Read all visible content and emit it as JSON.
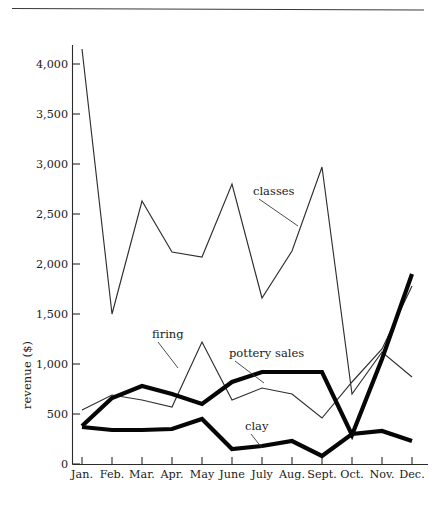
{
  "figure": {
    "y_axis_label": "revenue ($)",
    "has_top_rule": true
  },
  "chart_data": {
    "type": "line",
    "title": "",
    "subtitle": "",
    "xlabel": "",
    "ylabel": "revenue ($)",
    "categories": [
      "Jan.",
      "Feb.",
      "Mar.",
      "Apr.",
      "May",
      "June",
      "July",
      "Aug.",
      "Sept.",
      "Oct.",
      "Nov.",
      "Dec."
    ],
    "x_tick_labels": [
      "Jan.",
      "Feb.",
      "Mar.",
      "Apr.",
      "May",
      "June",
      "July",
      "Aug.",
      "Sept.",
      "Oct.",
      "Nov.",
      "Dec."
    ],
    "y_tick_labels": [
      "0",
      "500",
      "1,000",
      "1,500",
      "2,000",
      "2,500",
      "3,000",
      "3,500",
      "4,000"
    ],
    "y_tick_values": [
      0,
      500,
      1000,
      1500,
      2000,
      2500,
      3000,
      3500,
      4000
    ],
    "ylim": [
      0,
      4300
    ],
    "grid": false,
    "legend_position": "inline-annotations",
    "series": [
      {
        "name": "classes",
        "style": "thin",
        "color": "#2f2f2f",
        "values": [
          4150,
          1500,
          2630,
          2120,
          2070,
          2800,
          1660,
          2130,
          2970,
          700,
          1120,
          870
        ]
      },
      {
        "name": "firing",
        "style": "thin",
        "color": "#2f2f2f",
        "values": [
          540,
          690,
          640,
          570,
          1220,
          640,
          760,
          700,
          460,
          820,
          1150,
          1780
        ]
      },
      {
        "name": "pottery sales",
        "style": "thick",
        "color": "#060606",
        "values": [
          380,
          660,
          780,
          700,
          600,
          820,
          920,
          920,
          920,
          290,
          1050,
          1900
        ]
      },
      {
        "name": "clay",
        "style": "thick",
        "color": "#060606",
        "values": [
          370,
          340,
          340,
          350,
          450,
          150,
          180,
          230,
          80,
          300,
          330,
          230
        ]
      }
    ],
    "annotations": [
      {
        "text": "classes",
        "label_x": 253,
        "label_y": 195,
        "leader_to_x": 298,
        "leader_to_y": 226
      },
      {
        "text": "firing",
        "label_x": 152,
        "label_y": 338,
        "leader_to_x": 178,
        "leader_to_y": 368
      },
      {
        "text": "pottery sales",
        "label_x": 229,
        "label_y": 357,
        "leader_to_x": 264,
        "leader_to_y": 383
      },
      {
        "text": "clay",
        "label_x": 245,
        "label_y": 430,
        "leader_to_x": 262,
        "leader_to_y": 448
      }
    ]
  }
}
